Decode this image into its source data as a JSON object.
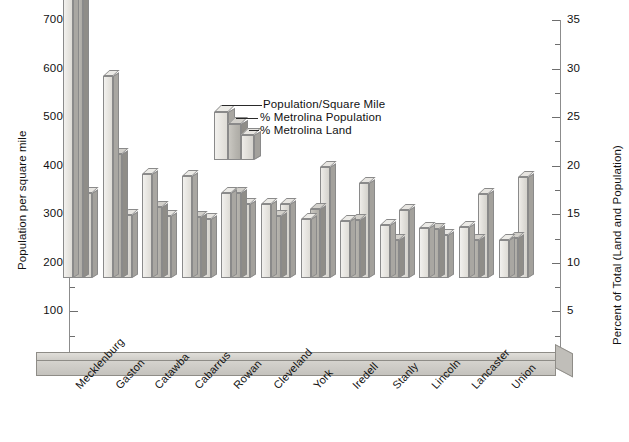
{
  "chart_data": {
    "type": "bar",
    "title": "",
    "xlabel": "",
    "ylabel": "Population per square mile",
    "y2label": "Percent of Total (Land and Population)",
    "ylim": [
      0,
      700
    ],
    "y2lim": [
      0,
      35
    ],
    "yticks": [
      0,
      100,
      200,
      300,
      400,
      500,
      600,
      700
    ],
    "ytick_labels": [
      "",
      "100",
      "200",
      "300",
      "400",
      "500",
      "600",
      "700"
    ],
    "y2ticks": [
      0,
      5,
      10,
      15,
      20,
      25,
      30,
      35
    ],
    "y2tick_labels": [
      "",
      "5",
      "10",
      "15",
      "20",
      "25",
      "30",
      "35"
    ],
    "grid": false,
    "legend_position": "upper-center",
    "categories": [
      "Mecklenburg",
      "Gaston",
      "Catawba",
      "Cabarrus",
      "Rowan",
      "Cleveland",
      "York",
      "Iredell",
      "Stanly",
      "Lincoln",
      "Lancaster",
      "Union"
    ],
    "series": [
      {
        "name": "Population/Square Mile",
        "axis": "left",
        "values": [
          660,
          415,
          215,
          210,
          175,
          152,
          122,
          118,
          110,
          103,
          105,
          78
        ]
      },
      {
        "name": "% Metrolina Population",
        "axis": "right",
        "values": [
          30.5,
          12.8,
          7.3,
          6.3,
          8.8,
          6.4,
          7.1,
          6.0,
          3.9,
          5.0,
          3.9,
          4.1
        ]
      },
      {
        "name": "% Metrolina Land",
        "axis": "right",
        "values": [
          8.8,
          6.5,
          6.4,
          6.1,
          7.6,
          7.6,
          11.4,
          9.8,
          7.0,
          4.4,
          8.6,
          10.4
        ]
      }
    ]
  },
  "legend": {
    "items": [
      {
        "label": "Population/Square Mile"
      },
      {
        "label": "% Metrolina Population"
      },
      {
        "label": "% Metrolina Land"
      }
    ]
  },
  "axes": {
    "left_title": "Population per square mile",
    "right_title": "Percent of Total (Land and Population)"
  }
}
